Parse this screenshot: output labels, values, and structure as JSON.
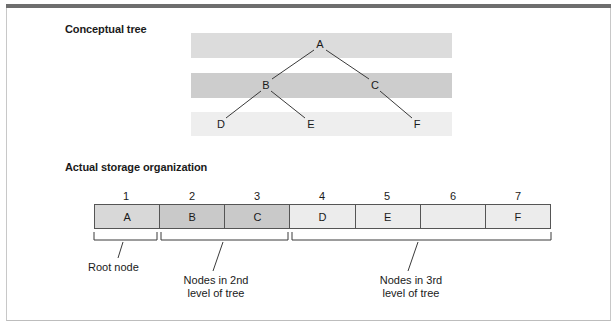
{
  "titles": {
    "conceptual": "Conceptual tree",
    "storage": "Actual storage organization"
  },
  "colors": {
    "level1": "#dcdcdc",
    "level2": "#cdcdcd",
    "level3": "#eeeeee",
    "topbar": "#6e6e6e"
  },
  "tree": {
    "nodes": [
      {
        "id": "A",
        "label": "A",
        "level": 1
      },
      {
        "id": "B",
        "label": "B",
        "level": 2
      },
      {
        "id": "C",
        "label": "C",
        "level": 2
      },
      {
        "id": "D",
        "label": "D",
        "level": 3
      },
      {
        "id": "E",
        "label": "E",
        "level": 3
      },
      {
        "id": "F",
        "label": "F",
        "level": 3
      }
    ],
    "edges": [
      [
        "A",
        "B"
      ],
      [
        "A",
        "C"
      ],
      [
        "B",
        "D"
      ],
      [
        "B",
        "E"
      ],
      [
        "C",
        "F"
      ]
    ]
  },
  "storage": {
    "indices": [
      "1",
      "2",
      "3",
      "4",
      "5",
      "6",
      "7"
    ],
    "cells": [
      "A",
      "B",
      "C",
      "D",
      "E",
      "",
      "F"
    ]
  },
  "captions": {
    "root": "Root node",
    "level2_line1": "Nodes in 2nd",
    "level2_line2": "level of tree",
    "level3_line1": "Nodes in 3rd",
    "level3_line2": "level of tree"
  }
}
